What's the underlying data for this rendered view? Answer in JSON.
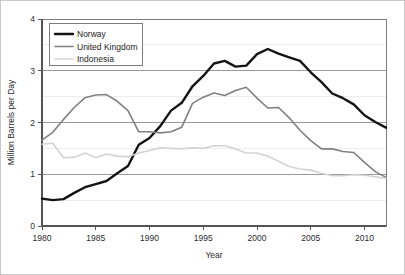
{
  "chart_data": {
    "type": "line",
    "title": "",
    "xlabel": "Year",
    "ylabel": "Million Barrels per Day",
    "xlim": [
      1980,
      2012
    ],
    "ylim": [
      0,
      4
    ],
    "xticks": [
      1980,
      1985,
      1990,
      1995,
      2000,
      2005,
      2010
    ],
    "yticks": [
      0,
      1,
      2,
      3,
      4
    ],
    "grid": true,
    "legend_position": "top-left",
    "x": [
      1980,
      1981,
      1982,
      1983,
      1984,
      1985,
      1986,
      1987,
      1988,
      1989,
      1990,
      1991,
      1992,
      1993,
      1994,
      1995,
      1996,
      1997,
      1998,
      1999,
      2000,
      2001,
      2002,
      2003,
      2004,
      2005,
      2006,
      2007,
      2008,
      2009,
      2010,
      2011,
      2012
    ],
    "series": [
      {
        "name": "Norway",
        "color": "#141414",
        "width": 2.4,
        "values": [
          0.53,
          0.5,
          0.52,
          0.64,
          0.75,
          0.81,
          0.87,
          1.02,
          1.16,
          1.57,
          1.7,
          1.93,
          2.23,
          2.38,
          2.7,
          2.9,
          3.14,
          3.19,
          3.08,
          3.1,
          3.32,
          3.42,
          3.33,
          3.26,
          3.19,
          2.97,
          2.78,
          2.56,
          2.47,
          2.35,
          2.14,
          2.01,
          1.9
        ],
        "peak_value": 3.42,
        "peak_year": 2001
      },
      {
        "name": "United Kingdom",
        "color": "#808080",
        "width": 1.6,
        "values": [
          1.66,
          1.81,
          2.06,
          2.29,
          2.48,
          2.53,
          2.54,
          2.41,
          2.23,
          1.82,
          1.82,
          1.8,
          1.82,
          1.91,
          2.37,
          2.49,
          2.57,
          2.52,
          2.62,
          2.68,
          2.47,
          2.28,
          2.29,
          2.09,
          1.85,
          1.65,
          1.49,
          1.49,
          1.44,
          1.42,
          1.23,
          1.05,
          0.94
        ],
        "peak_value": 2.68,
        "peak_year": 1999
      },
      {
        "name": "Indonesia",
        "color": "#d3d3d3",
        "width": 1.6,
        "values": [
          1.58,
          1.6,
          1.32,
          1.33,
          1.41,
          1.32,
          1.39,
          1.35,
          1.34,
          1.41,
          1.46,
          1.51,
          1.5,
          1.49,
          1.51,
          1.5,
          1.55,
          1.55,
          1.49,
          1.41,
          1.41,
          1.35,
          1.25,
          1.15,
          1.1,
          1.08,
          1.02,
          0.97,
          0.97,
          0.99,
          0.98,
          0.95,
          0.92
        ],
        "peak_value": 1.6,
        "peak_year": 1981
      }
    ],
    "legend_entries": [
      "Norway",
      "United Kingdom",
      "Indonesia"
    ]
  },
  "legend": {
    "items": [
      {
        "label": "Norway"
      },
      {
        "label": "United Kingdom"
      },
      {
        "label": "Indonesia"
      }
    ]
  },
  "axes": {
    "y_title": "Million Barrels per Day",
    "x_title": "Year",
    "y_tick_labels": [
      "0",
      "1",
      "2",
      "3",
      "4"
    ],
    "x_tick_labels": [
      "1980",
      "1985",
      "1990",
      "1995",
      "2000",
      "2005",
      "2010"
    ]
  }
}
